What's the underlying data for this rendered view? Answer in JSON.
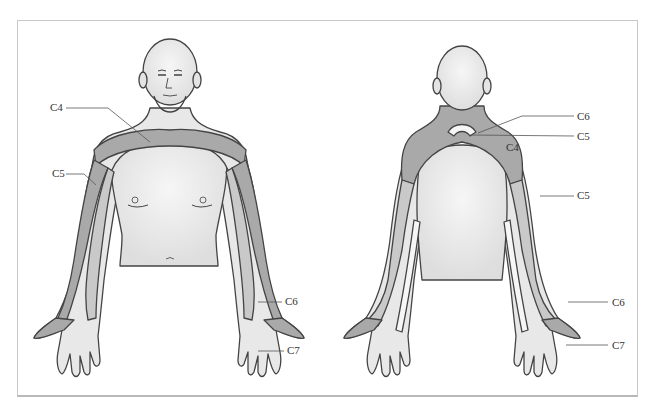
{
  "figure": {
    "colors": {
      "skin": "#e6e6e6",
      "skin_highlight": "#f4f4f4",
      "band_dark": "#a9a9a9",
      "band_light": "#c9c9c9",
      "band_white": "#f6f6f6",
      "outline": "#444444",
      "frame": "#c8c8c8"
    },
    "anterior_view": {
      "labels": [
        {
          "id": "C4",
          "text": "C4"
        },
        {
          "id": "C5",
          "text": "C5"
        },
        {
          "id": "C6",
          "text": "C6"
        },
        {
          "id": "C7",
          "text": "C7"
        }
      ]
    },
    "posterior_view": {
      "labels": [
        {
          "id": "C6-top",
          "text": "C6"
        },
        {
          "id": "C5-top",
          "text": "C5"
        },
        {
          "id": "C4",
          "text": "C4"
        },
        {
          "id": "C5-arm",
          "text": "C5"
        },
        {
          "id": "C6-forearm",
          "text": "C6"
        },
        {
          "id": "C7-hand",
          "text": "C7"
        }
      ]
    }
  }
}
